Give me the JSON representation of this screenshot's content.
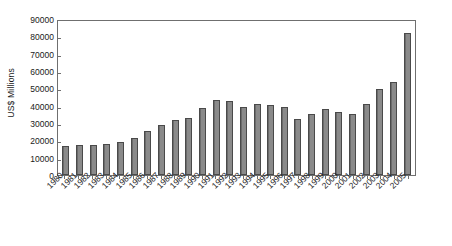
{
  "chart_data": {
    "type": "bar",
    "title": "",
    "subtitle": "",
    "xlabel": "",
    "ylabel": "US$ Millions",
    "ylim": [
      0,
      90000
    ],
    "ytick_step": 10000,
    "yticks": [
      0,
      10000,
      20000,
      30000,
      40000,
      50000,
      60000,
      70000,
      80000,
      90000
    ],
    "ytick_labels": [
      "0",
      "10000",
      "20000",
      "30000",
      "40000",
      "50000",
      "60000",
      "70000",
      "80000",
      "90000"
    ],
    "grid": false,
    "legend": null,
    "bar_color": "#808080",
    "bar_edge_color": "#4a4a4a",
    "categories": [
      "1980",
      "1981",
      "1982",
      "1983",
      "1984",
      "1985",
      "1986",
      "1987",
      "1988",
      "1989",
      "1990",
      "1991",
      "1992",
      "1993",
      "1994",
      "1995",
      "1996",
      "1997",
      "1998",
      "1999",
      "2000",
      "2001",
      "2002",
      "2003",
      "2004",
      "2005"
    ],
    "values": [
      16800,
      17200,
      17600,
      17800,
      19000,
      21200,
      25200,
      28900,
      32000,
      33000,
      38500,
      43000,
      42800,
      39200,
      41000,
      40300,
      39100,
      32500,
      35300,
      37800,
      36200,
      35000,
      40700,
      49500,
      53500,
      82000
    ]
  },
  "caption": {
    "text": ""
  }
}
